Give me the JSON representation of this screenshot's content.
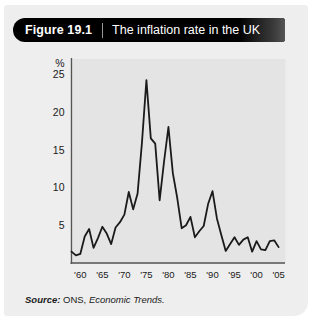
{
  "figure": {
    "number": "Figure 19.1",
    "title": "The inflation rate in the UK"
  },
  "source": {
    "label": "Source:",
    "organisation": " ONS,",
    "publication": " Economic Trends."
  },
  "colors": {
    "card_background": "#eeeeee",
    "plot_background": "#e4e4e4",
    "banner": "#000000",
    "line": "#1a1a1a",
    "axis": "#555555",
    "text": "#1a1a1a"
  },
  "chart_data": {
    "type": "line",
    "title": "The inflation rate in the UK",
    "xlabel": "",
    "ylabel": "%",
    "ylim": [
      0,
      27
    ],
    "xlim": [
      1958,
      2006
    ],
    "grid": false,
    "legend": null,
    "y_ticks": [
      5,
      10,
      15,
      20,
      25
    ],
    "y_tick_labels": [
      "5",
      "10",
      "15",
      "20",
      "25"
    ],
    "y_axis_unit_label": "%",
    "x_ticks": [
      1960,
      1965,
      1970,
      1975,
      1980,
      1985,
      1990,
      1995,
      2000,
      2005
    ],
    "x_tick_labels": [
      "'60",
      "'65",
      "'70",
      "'75",
      "'80",
      "'85",
      "'90",
      "'95",
      "'00",
      "'05"
    ],
    "series": [
      {
        "name": "UK inflation rate",
        "x": [
          1958,
          1959,
          1960,
          1961,
          1962,
          1963,
          1964,
          1965,
          1966,
          1967,
          1968,
          1969,
          1970,
          1971,
          1972,
          1973,
          1974,
          1975,
          1976,
          1977,
          1978,
          1979,
          1980,
          1981,
          1982,
          1983,
          1984,
          1985,
          1986,
          1987,
          1988,
          1989,
          1990,
          1991,
          1992,
          1993,
          1994,
          1995,
          1996,
          1997,
          1998,
          1999,
          2000,
          2001,
          2002,
          2003,
          2004,
          2005
        ],
        "values": [
          1.5,
          1.0,
          1.2,
          3.5,
          4.5,
          2.0,
          3.3,
          4.8,
          3.9,
          2.5,
          4.7,
          5.4,
          6.4,
          9.4,
          7.1,
          9.2,
          16.0,
          24.2,
          16.5,
          15.8,
          8.3,
          13.4,
          18.0,
          11.9,
          8.6,
          4.6,
          5.0,
          6.1,
          3.4,
          4.2,
          4.9,
          7.8,
          9.5,
          5.9,
          3.7,
          1.6,
          2.5,
          3.4,
          2.4,
          3.1,
          3.4,
          1.5,
          2.9,
          1.8,
          1.7,
          2.9,
          3.0,
          2.1
        ]
      }
    ]
  }
}
